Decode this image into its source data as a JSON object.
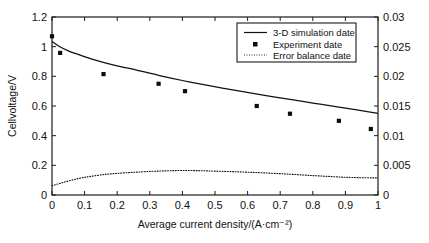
{
  "chart_data": {
    "type": "line",
    "title": "",
    "xlabel": "Average current density/(A·cm⁻²)",
    "ylabel": "Cellvoltage/V",
    "ylabel_right": "",
    "xlim": [
      0,
      1
    ],
    "ylim": [
      0,
      1.2
    ],
    "ylim_right": [
      0,
      0.03
    ],
    "grid": false,
    "legend_position": "top-right",
    "xticks": [
      "0",
      "0.1",
      "0.2",
      "0.3",
      "0.4",
      "0.5",
      "0.6",
      "0.7",
      "0.8",
      "0.9",
      "1"
    ],
    "xtick_values": [
      0,
      0.1,
      0.2,
      0.3,
      0.4,
      0.5,
      0.6,
      0.7,
      0.8,
      0.9,
      1
    ],
    "yticks": [
      "0",
      "0.2",
      "0.4",
      "0.6",
      "0.8",
      "1",
      "1.2"
    ],
    "ytick_values": [
      0,
      0.2,
      0.4,
      0.6,
      0.8,
      1.0,
      1.2
    ],
    "yticks_right": [
      "0",
      "0.005",
      "0.01",
      "0.015",
      "0.02",
      "0.025",
      "0.03"
    ],
    "ytick_values_right": [
      0,
      0.005,
      0.01,
      0.015,
      0.02,
      0.025,
      0.03
    ],
    "series": [
      {
        "name": "3-D simulation date",
        "style": "solid-line",
        "axis": "left",
        "x": [
          0.0,
          0.02,
          0.05,
          0.08,
          0.12,
          0.16,
          0.21,
          0.26,
          0.33,
          0.4,
          0.47,
          0.55,
          0.63,
          0.72,
          0.8,
          0.88,
          0.94,
          1.0
        ],
        "y": [
          1.035,
          1.005,
          0.972,
          0.948,
          0.918,
          0.893,
          0.866,
          0.842,
          0.805,
          0.772,
          0.742,
          0.71,
          0.68,
          0.648,
          0.62,
          0.592,
          0.572,
          0.55
        ]
      },
      {
        "name": "Experiment date",
        "style": "square-markers",
        "axis": "left",
        "x": [
          0.0,
          0.025,
          0.158,
          0.327,
          0.408,
          0.628,
          0.73,
          0.88,
          0.978
        ],
        "y": [
          1.07,
          0.958,
          0.815,
          0.75,
          0.7,
          0.6,
          0.548,
          0.5,
          0.445
        ]
      },
      {
        "name": "Error balance date",
        "style": "dotted-line",
        "axis": "left",
        "x": [
          0.0,
          0.03,
          0.06,
          0.09,
          0.12,
          0.16,
          0.2,
          0.25,
          0.3,
          0.35,
          0.4,
          0.45,
          0.5,
          0.56,
          0.62,
          0.68,
          0.74,
          0.8,
          0.86,
          0.92,
          1.0
        ],
        "y": [
          0.062,
          0.082,
          0.1,
          0.115,
          0.126,
          0.138,
          0.146,
          0.153,
          0.159,
          0.163,
          0.165,
          0.164,
          0.161,
          0.157,
          0.152,
          0.146,
          0.139,
          0.131,
          0.124,
          0.118,
          0.115
        ],
        "y_right": [
          0.00155,
          0.00205,
          0.0025,
          0.00288,
          0.00315,
          0.00345,
          0.00365,
          0.00383,
          0.00398,
          0.00408,
          0.00413,
          0.0041,
          0.00403,
          0.00393,
          0.0038,
          0.00365,
          0.00348,
          0.00328,
          0.0031,
          0.00295,
          0.00288
        ]
      }
    ]
  },
  "legend": {
    "items": [
      {
        "label": "3-D simulation date",
        "marker": "line"
      },
      {
        "label": "Experiment date",
        "marker": "square"
      },
      {
        "label": "Error balance date",
        "marker": "dotted"
      }
    ]
  },
  "axes": {
    "x_title": "Average current density/(A·cm⁻²)",
    "y_title": "Cellvoltage/V"
  },
  "colors": {
    "foreground": "#111111",
    "background": "#ffffff"
  }
}
